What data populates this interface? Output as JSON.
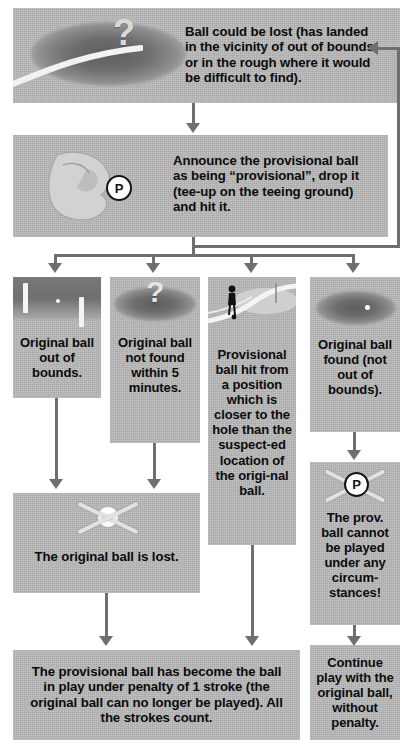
{
  "diagram": {
    "box_fill": "#b9b9b9",
    "connector_color": "#6f6f6f",
    "text_color": "#0b0b0b"
  },
  "nodes": {
    "ball_could_be_lost": {
      "text": "Ball could be lost (has landed in the vicinity of out of bounds, or in the rough where it would be difficult to find).",
      "icon": "rough-with-question-mark"
    },
    "announce_provisional": {
      "text": "Announce the provisional ball as being “provisional”, drop it (tee-up on the teeing ground) and hit it.",
      "icon": "hand-dropping-ball",
      "badge": "P"
    },
    "out_of_bounds": {
      "text": "Original ball out of bounds.",
      "icon": "out-of-bounds-stakes"
    },
    "not_found": {
      "text": "Original ball not found within 5 minutes.",
      "icon": "rough-with-question-mark"
    },
    "provisional_closer": {
      "text": "Provisional ball hit from a position which is closer to the hole than the suspect-ed location of the origi-nal ball.",
      "icon": "golfer-near-green"
    },
    "original_found": {
      "text": "Original ball found (not out of bounds).",
      "icon": "ball-in-rough"
    },
    "original_lost": {
      "text": "The original ball is lost.",
      "icon": "ball-crossed-out"
    },
    "prov_cannot_be_played": {
      "text": "The prov. ball cannot be played under any circum-stances!",
      "icon": "provisional-ball-crossed-out",
      "badge": "P"
    },
    "provisional_in_play": {
      "text": "The provisional ball has become the ball in play under penalty of 1 stroke (the original ball can no longer be played). All the strokes count."
    },
    "continue_with_original": {
      "text": "Continue play with the original ball, without penalty."
    }
  },
  "connectors": [
    {
      "from": "ball_could_be_lost",
      "to": "announce_provisional",
      "kind": "arrow-down"
    },
    {
      "from": "announce_provisional",
      "to": "out_of_bounds",
      "kind": "arrow-down"
    },
    {
      "from": "announce_provisional",
      "to": "not_found",
      "kind": "arrow-down"
    },
    {
      "from": "announce_provisional",
      "to": "provisional_closer",
      "kind": "arrow-down"
    },
    {
      "from": "announce_provisional",
      "to": "original_found",
      "kind": "arrow-down"
    },
    {
      "from": "out_of_bounds",
      "to": "original_lost",
      "kind": "arrow-down"
    },
    {
      "from": "not_found",
      "to": "original_lost",
      "kind": "arrow-down"
    },
    {
      "from": "original_lost",
      "to": "provisional_in_play",
      "kind": "arrow-down"
    },
    {
      "from": "provisional_closer",
      "to": "provisional_in_play",
      "kind": "arrow-down"
    },
    {
      "from": "original_found",
      "to": "prov_cannot_be_played",
      "kind": "arrow-down"
    },
    {
      "from": "prov_cannot_be_played",
      "to": "continue_with_original",
      "kind": "arrow-down"
    },
    {
      "from": "announce_provisional",
      "to": "ball_could_be_lost",
      "kind": "loop-back-right"
    }
  ]
}
